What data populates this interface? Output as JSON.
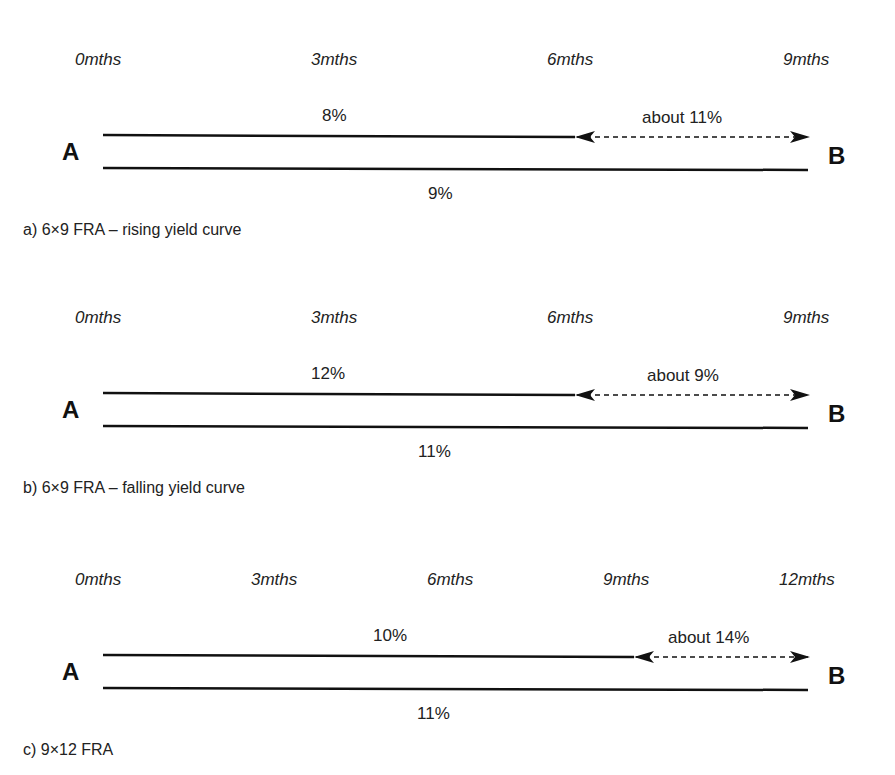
{
  "panels": [
    {
      "id": "a",
      "caption": "a) 6×9 FRA – rising yield curve",
      "ticks": [
        {
          "label": "0mths",
          "x": 75
        },
        {
          "label": "3mths",
          "x": 311
        },
        {
          "label": "6mths",
          "x": 547
        },
        {
          "label": "9mths",
          "x": 783
        }
      ],
      "top": 10,
      "upper_rate": "8%",
      "upper_rate_x": 322,
      "lower_rate": "9%",
      "lower_rate_x": 428,
      "forward_rate": "about 11%",
      "forward_rate_x": 642,
      "arrow_start_x": 575,
      "start_label": "A",
      "end_label": "B"
    },
    {
      "id": "b",
      "caption": "b) 6×9 FRA – falling yield curve",
      "ticks": [
        {
          "label": "0mths",
          "x": 75
        },
        {
          "label": "3mths",
          "x": 311
        },
        {
          "label": "6mths",
          "x": 547
        },
        {
          "label": "9mths",
          "x": 783
        }
      ],
      "top": 268,
      "upper_rate": "12%",
      "upper_rate_x": 311,
      "lower_rate": "11%",
      "lower_rate_x": 418,
      "forward_rate": "about 9%",
      "forward_rate_x": 647,
      "arrow_start_x": 575,
      "start_label": "A",
      "end_label": "B"
    },
    {
      "id": "c",
      "caption": "c) 9×12 FRA",
      "ticks": [
        {
          "label": "0mths",
          "x": 75
        },
        {
          "label": "3mths",
          "x": 251
        },
        {
          "label": "6mths",
          "x": 427
        },
        {
          "label": "9mths",
          "x": 603
        },
        {
          "label": "12mths",
          "x": 779
        }
      ],
      "top": 530,
      "upper_rate": "10%",
      "upper_rate_x": 373,
      "lower_rate": "11%",
      "lower_rate_x": 417,
      "forward_rate": "about 14%",
      "forward_rate_x": 668,
      "arrow_start_x": 634,
      "start_label": "A",
      "end_label": "B"
    }
  ]
}
